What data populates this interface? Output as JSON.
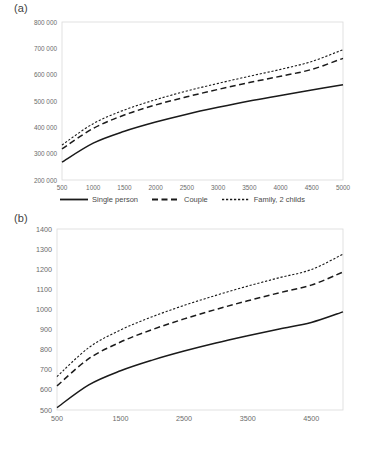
{
  "figures": [
    {
      "panel_label": "(a)",
      "legend": [
        {
          "label": "Single person",
          "style": "solid"
        },
        {
          "label": "Couple",
          "style": "dashed"
        },
        {
          "label": "Family, 2 childs",
          "style": "dotted"
        }
      ]
    },
    {
      "panel_label": "(b)",
      "legend": [
        {
          "label": "Single person",
          "style": "solid"
        },
        {
          "label": "Couple",
          "style": "dashed"
        },
        {
          "label": "Family, 2 childs",
          "style": "dotted"
        }
      ]
    }
  ],
  "colors": {
    "line": "#1a1a1a",
    "axis": "#d9d9d9",
    "tick_text": "#6b6b6b",
    "background": "#ffffff"
  },
  "chart_data": [
    {
      "type": "line",
      "title": "(a)",
      "xlabel": "",
      "ylabel": "",
      "grid": false,
      "legend_position": "bottom",
      "xlim": [
        500,
        5000
      ],
      "ylim": [
        200000,
        800000
      ],
      "xticks": [
        500,
        1000,
        1500,
        2000,
        2500,
        3000,
        3500,
        4000,
        4500,
        5000
      ],
      "xticklabels": [
        "500",
        "1000",
        "1500",
        "2000",
        "2500",
        "3000",
        "3500",
        "4000",
        "4500",
        "5000"
      ],
      "yticks": [
        200000,
        300000,
        400000,
        500000,
        600000,
        700000,
        800000
      ],
      "yticklabels": [
        "200 000",
        "300 000",
        "400 000",
        "500 000",
        "600 000",
        "700 000",
        "800 000"
      ],
      "x": [
        500,
        1000,
        1500,
        2000,
        2500,
        3000,
        3500,
        4000,
        4500,
        5000
      ],
      "series": [
        {
          "name": "Single person",
          "style": "solid",
          "values": [
            268000,
            340000,
            385000,
            420000,
            450000,
            476000,
            500000,
            521000,
            542000,
            562000
          ]
        },
        {
          "name": "Couple",
          "style": "dashed",
          "values": [
            318000,
            396000,
            447000,
            485000,
            516000,
            544000,
            570000,
            594000,
            620000,
            662000
          ]
        },
        {
          "name": "Family, 2 childs",
          "style": "dotted",
          "values": [
            333000,
            414000,
            466000,
            505000,
            538000,
            567000,
            594000,
            620000,
            650000,
            695000
          ]
        }
      ]
    },
    {
      "type": "line",
      "title": "(b)",
      "xlabel": "",
      "ylabel": "",
      "grid": false,
      "legend_position": "bottom",
      "xlim": [
        500,
        5000
      ],
      "ylim": [
        500,
        1400
      ],
      "xticks": [
        500,
        1500,
        2500,
        3500,
        4500
      ],
      "xticklabels": [
        "500",
        "1500",
        "2500",
        "3500",
        "4500"
      ],
      "yticks": [
        500,
        600,
        700,
        800,
        900,
        1000,
        1100,
        1200,
        1300,
        1400
      ],
      "yticklabels": [
        "500",
        "600",
        "700",
        "800",
        "900",
        "1000",
        "1100",
        "1200",
        "1300",
        "1400"
      ],
      "x": [
        500,
        1000,
        1500,
        2000,
        2500,
        3000,
        3500,
        4000,
        4500,
        5000
      ],
      "series": [
        {
          "name": "Single person",
          "style": "solid",
          "values": [
            512,
            625,
            695,
            748,
            793,
            833,
            869,
            903,
            935,
            988
          ]
        },
        {
          "name": "Couple",
          "style": "dashed",
          "values": [
            620,
            755,
            838,
            900,
            953,
            1000,
            1043,
            1083,
            1121,
            1186
          ]
        },
        {
          "name": "Family, 2 childs",
          "style": "dotted",
          "values": [
            666,
            810,
            898,
            964,
            1020,
            1070,
            1116,
            1158,
            1198,
            1275
          ]
        }
      ]
    }
  ]
}
